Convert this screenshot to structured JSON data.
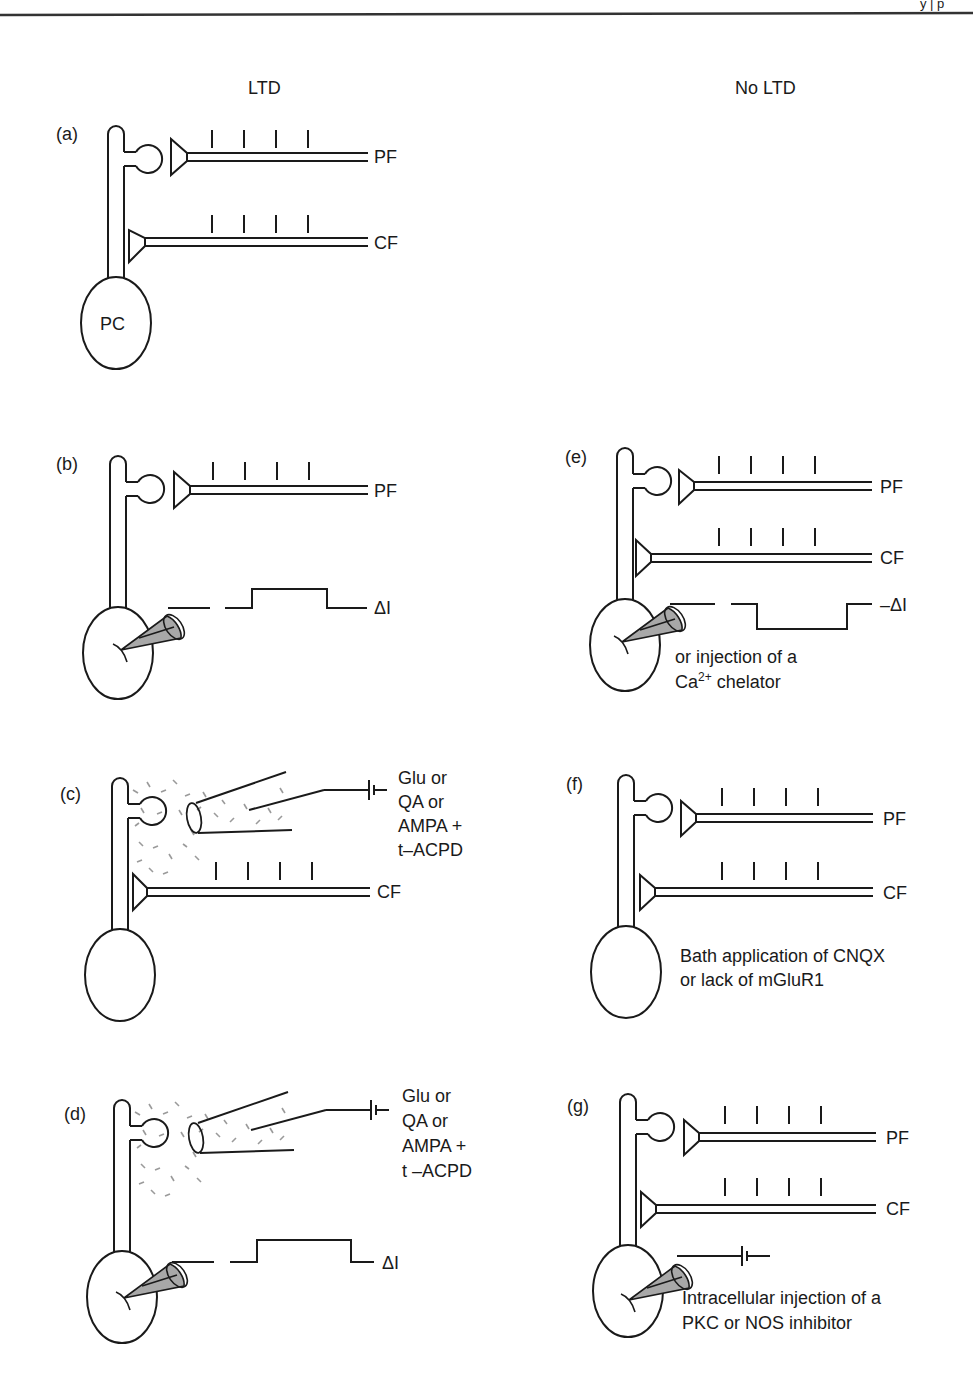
{
  "figure": {
    "page_header_fragment": "y | p",
    "column_headers": {
      "left": "LTD",
      "right": "No LTD"
    },
    "colors": {
      "line": "#1a1a1a",
      "pipette_fill": "#a8a8a8",
      "drug_particles": "#9a9a9a",
      "background": "#ffffff"
    },
    "panels": [
      {
        "id": "a",
        "label": "(a)",
        "column": "LTD",
        "fibers": [
          "PF",
          "CF"
        ],
        "soma_label": "PC",
        "stimulus_ticks_per_fiber": 4
      },
      {
        "id": "b",
        "label": "(b)",
        "column": "LTD",
        "fibers": [
          "PF"
        ],
        "current_injection": "ΔI",
        "trace": "positive step"
      },
      {
        "id": "c",
        "label": "(c)",
        "column": "LTD",
        "fibers": [
          "CF"
        ],
        "drug_application": [
          "Glu or",
          "QA or",
          "AMPA +",
          "t–ACPD"
        ]
      },
      {
        "id": "d",
        "label": "(d)",
        "column": "LTD",
        "current_injection": "ΔI",
        "trace": "positive step",
        "drug_application": [
          "Glu or",
          "QA or",
          "AMPA +",
          "t –ACPD"
        ]
      },
      {
        "id": "e",
        "label": "(e)",
        "column": "No LTD",
        "fibers": [
          "PF",
          "CF"
        ],
        "current_injection": "–ΔI",
        "trace": "negative step",
        "note": [
          "or injection of a",
          "Ca",
          "2+",
          " chelator"
        ]
      },
      {
        "id": "f",
        "label": "(f)",
        "column": "No LTD",
        "fibers": [
          "PF",
          "CF"
        ],
        "note": [
          "Bath application of CNQX",
          "or lack of mGluR1"
        ]
      },
      {
        "id": "g",
        "label": "(g)",
        "column": "No LTD",
        "fibers": [
          "PF",
          "CF"
        ],
        "note": [
          "Intracellular injection of a",
          "PKC or NOS inhibitor"
        ]
      }
    ]
  }
}
